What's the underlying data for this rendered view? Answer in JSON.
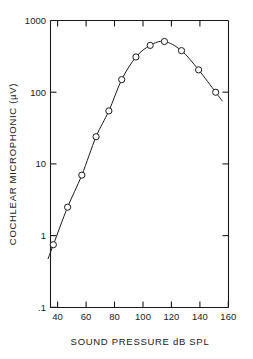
{
  "chart_data": {
    "type": "line",
    "title": "",
    "xlabel": "SOUND PRESSURE dB SPL",
    "ylabel": "COCHLEAR MICROPHONIC (µV)",
    "xlim": [
      35,
      160
    ],
    "ylim": [
      0.1,
      1000
    ],
    "yscale": "log",
    "xscale": "linear",
    "grid": false,
    "legend": null,
    "x_ticks": [
      40,
      60,
      80,
      100,
      120,
      140,
      160
    ],
    "x_tick_labels": [
      "40",
      "60",
      "80",
      "100",
      "120",
      "140",
      "160"
    ],
    "y_ticks": [
      0.1,
      1,
      10,
      100,
      1000
    ],
    "y_tick_labels": [
      ".1",
      "1",
      "10",
      "100",
      "1000"
    ],
    "marker": "open-circle",
    "series": [
      {
        "name": "cochlear microphonic",
        "x": [
          37,
          47,
          57,
          67,
          76,
          85,
          95,
          105,
          115,
          127,
          139,
          151
        ],
        "values": [
          0.75,
          2.5,
          7.0,
          24,
          55,
          150,
          310,
          450,
          510,
          380,
          205,
          100
        ]
      }
    ],
    "line_extends_before_first_point": true,
    "line_extends_after_last_point": true
  },
  "labels": {
    "x_axis_title": "SOUND PRESSURE dB SPL",
    "y_axis_title": "COCHLEAR MICROPHONIC (µV)",
    "y_1000": "1000",
    "y_100": "100",
    "y_10": "10",
    "y_1": "1",
    "y_01": ".1",
    "x_40": "40",
    "x_60": "60",
    "x_80": "80",
    "x_100": "100",
    "x_120": "120",
    "x_140": "140",
    "x_160": "160"
  },
  "style": {
    "background": "#ffffff",
    "ink": "#1a1a1a"
  }
}
